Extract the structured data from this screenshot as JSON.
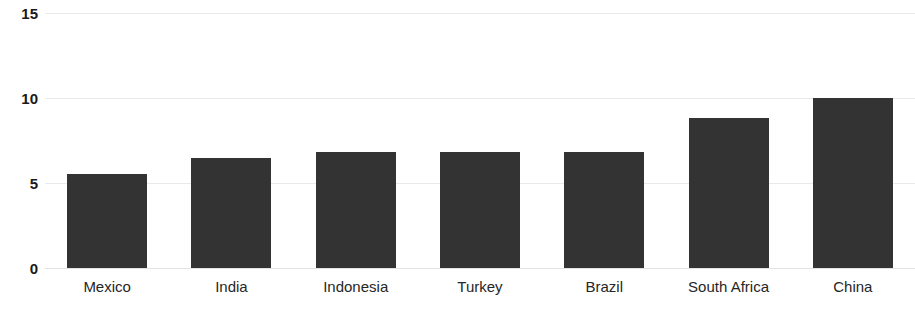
{
  "chart_data": {
    "type": "bar",
    "title": "",
    "subtitle": "",
    "xlabel": "",
    "ylabel": "",
    "categories": [
      "Mexico",
      "India",
      "Indonesia",
      "Turkey",
      "Brazil",
      "South Africa",
      "China"
    ],
    "values": [
      5.55,
      6.45,
      6.8,
      6.85,
      6.85,
      8.8,
      10.0
    ],
    "ylim": [
      0,
      15
    ],
    "yticks": [
      0,
      5,
      10,
      15
    ],
    "ytick_labels": [
      "0",
      "5",
      "10",
      "15"
    ],
    "grid": true,
    "legend": "none",
    "series": [
      {
        "name": "",
        "values": [
          5.55,
          6.45,
          6.8,
          6.85,
          6.85,
          8.8,
          10.0
        ]
      }
    ],
    "colors": {
      "bar": "#333333",
      "gridline": "#e9e9e9",
      "axis_text": "#1a1a1a",
      "category_text": "#262626",
      "background": "#ffffff"
    }
  }
}
